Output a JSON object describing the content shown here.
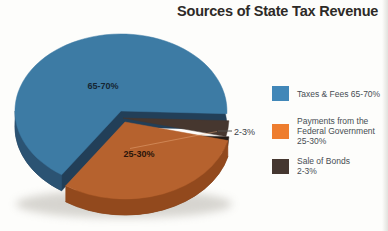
{
  "header": {
    "title": "Sources of State Tax Revenue"
  },
  "chart_data": {
    "type": "pie",
    "title": "Sources of State Tax Revenue",
    "style": "3d-exploded-pie",
    "legend_position": "right",
    "slices": [
      {
        "key": "taxes-fees",
        "name": "Taxes & Fees",
        "range": "65-70%",
        "value_mid": 67.5,
        "data_label": "65-70%",
        "sweep_deg": 238,
        "color_top": "#3d7ba4",
        "color_side": "#223f58",
        "color_rim": "#2b5373",
        "color_legend": "#4187b8",
        "label_color": "#152633"
      },
      {
        "key": "federal-payments",
        "name": "Payments from the Federal Government",
        "range": "25-30%",
        "value_mid": 27.5,
        "data_label": "25-30%",
        "sweep_deg": 110,
        "color_top": "#b6622e",
        "color_side": "#7a3b15",
        "color_rim": "#92491d",
        "color_legend": "#ee7d2e",
        "label_color": "#2a150a"
      },
      {
        "key": "sale-of-bonds",
        "name": "Sale of Bonds",
        "range": "2-3%",
        "value_mid": 2.5,
        "data_label": "2-3%",
        "sweep_deg": 12,
        "color_top": "#46372f",
        "color_side": "#241b16",
        "color_rim": "#2e231d",
        "color_legend": "#453730",
        "label_color": "#3c4147"
      }
    ]
  },
  "legend": {
    "items": [
      {
        "swatch_color": "#4187b8",
        "lines": [
          "Taxes & Fees 65-70%"
        ]
      },
      {
        "swatch_color": "#ee7d2e",
        "lines": [
          "Payments from the",
          "Federal Government",
          "25-30%"
        ]
      },
      {
        "swatch_color": "#453730",
        "lines": [
          "Sale of Bonds",
          "2-3%"
        ]
      }
    ]
  }
}
